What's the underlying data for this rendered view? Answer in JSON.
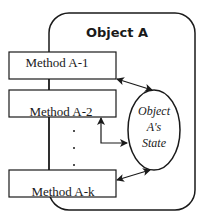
{
  "diagram": {
    "object": {
      "title": "Object A"
    },
    "methods": [
      {
        "label": "Method A-1"
      },
      {
        "label": "Method A-2"
      },
      {
        "label": "Method A-k"
      }
    ],
    "state": {
      "line1": "Object",
      "line2": "A's",
      "line3": "State"
    },
    "ellipsis": "..."
  },
  "colors": {
    "stroke": "#1a1a1a",
    "background": "#ffffff"
  }
}
